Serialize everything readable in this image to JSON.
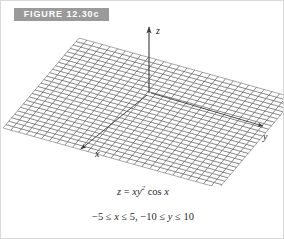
{
  "figure": {
    "banner_label": "FIGURE 12.30c",
    "banner_bg": "#9a9a9a",
    "banner_text_color": "#ffffff"
  },
  "caption": {
    "equation_lhs": "z",
    "equation_eq": " = ",
    "equation_x": "xy",
    "equation_exp": "2",
    "equation_cos": " cos ",
    "equation_var": "x",
    "domain_x_low": "−5 ≤ ",
    "domain_x_var": "x",
    "domain_x_high": " ≤ 5, ",
    "domain_y_low": "−10 ≤ ",
    "domain_y_var": "y",
    "domain_y_high": " ≤ 10"
  },
  "axes": {
    "x_label": "x",
    "y_label": "y",
    "z_label": "z",
    "line_color": "#3a3a3a"
  },
  "chart_data": {
    "type": "surface",
    "title": "FIGURE 12.30c",
    "equation": "z = x*y^2*cos(x)",
    "xlabel": "x",
    "ylabel": "y",
    "zlabel": "z",
    "xlim": [
      -5,
      5
    ],
    "ylim": [
      -10,
      10
    ],
    "grid": true,
    "mesh_color": "#303030",
    "surface_fill": "#ffffff",
    "nu": 26,
    "nv": 28,
    "projection": {
      "type": "oblique-axonometric",
      "origin_px": [
        148,
        92
      ],
      "x_axis_px": [
        -38,
        45
      ],
      "y_axis_px": [
        108,
        30
      ],
      "z_scale_px": -0.00028
    }
  }
}
